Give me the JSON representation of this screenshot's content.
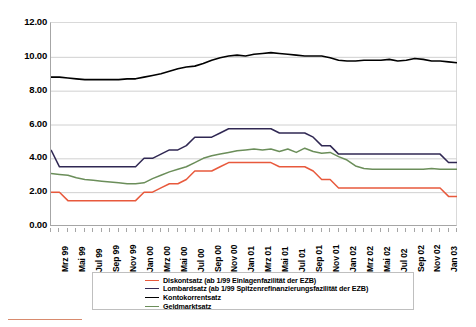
{
  "chart_data": {
    "type": "line",
    "title": "",
    "xlabel": "",
    "ylabel": "",
    "ylim": [
      0,
      12
    ],
    "ytick_labels": [
      "12.00",
      "10.00",
      "8.00",
      "6.00",
      "4.00",
      "2.00",
      "0.00"
    ],
    "ytick_values": [
      12,
      10,
      8,
      6,
      4,
      2,
      0
    ],
    "grid": true,
    "legend_position": "bottom-center",
    "x": [
      "Jan 99",
      "Feb 99",
      "Mrz 99",
      "Apr 99",
      "Mai 99",
      "Jun 99",
      "Jul 99",
      "Aug 99",
      "Sep 99",
      "Okt 99",
      "Nov 99",
      "Dez 99",
      "Jan 00",
      "Feb 00",
      "Mrz 00",
      "Apr 00",
      "Mai 00",
      "Jun 00",
      "Jul 00",
      "Aug 00",
      "Sep 00",
      "Okt 00",
      "Nov 00",
      "Dez 00",
      "Jan 01",
      "Feb 01",
      "Mrz 01",
      "Apr 01",
      "Mai 01",
      "Jun 01",
      "Jul 01",
      "Aug 01",
      "Sep 01",
      "Okt 01",
      "Nov 01",
      "Dez 01",
      "Jan 02",
      "Feb 02",
      "Mrz 02",
      "Apr 02",
      "Mai 02",
      "Jun 02",
      "Jul 02",
      "Aug 02",
      "Sep 02",
      "Okt 02",
      "Nov 02",
      "Dez 02",
      "Jan 03"
    ],
    "x_tick_labels": [
      "Mrz 99",
      "Mai 99",
      "Jul 99",
      "Sep 99",
      "Nov 99",
      "Jan 00",
      "Mrz 00",
      "Mai 00",
      "Jul 00",
      "Sep 00",
      "Nov 00",
      "Jan 01",
      "Mrz 01",
      "Mai 01",
      "Jul 01",
      "Sep 01",
      "Nov 01",
      "Jan 02",
      "Mrz 02",
      "Mai 02",
      "Jul 02",
      "Sep 02",
      "Nov 02",
      "Jan 03"
    ],
    "series": [
      {
        "name": "Diskontsatz (ab 1/99 Einlagenfazilität der EZB)",
        "color": "#E8593C",
        "values": [
          2.0,
          2.0,
          1.5,
          1.5,
          1.5,
          1.5,
          1.5,
          1.5,
          1.5,
          1.5,
          1.5,
          2.0,
          2.0,
          2.25,
          2.5,
          2.5,
          2.75,
          3.25,
          3.25,
          3.25,
          3.5,
          3.75,
          3.75,
          3.75,
          3.75,
          3.75,
          3.75,
          3.5,
          3.5,
          3.5,
          3.5,
          3.25,
          2.75,
          2.75,
          2.25,
          2.25,
          2.25,
          2.25,
          2.25,
          2.25,
          2.25,
          2.25,
          2.25,
          2.25,
          2.25,
          2.25,
          2.25,
          1.75,
          1.75
        ]
      },
      {
        "name": "Lombardsatz (ab 1/99 Spitzenrefinanzierungsfazilität der EZB)",
        "color": "#302853",
        "values": [
          4.5,
          3.5,
          3.5,
          3.5,
          3.5,
          3.5,
          3.5,
          3.5,
          3.5,
          3.5,
          3.5,
          4.0,
          4.0,
          4.25,
          4.5,
          4.5,
          4.75,
          5.25,
          5.25,
          5.25,
          5.5,
          5.75,
          5.75,
          5.75,
          5.75,
          5.75,
          5.75,
          5.5,
          5.5,
          5.5,
          5.5,
          5.25,
          4.75,
          4.75,
          4.25,
          4.25,
          4.25,
          4.25,
          4.25,
          4.25,
          4.25,
          4.25,
          4.25,
          4.25,
          4.25,
          4.25,
          4.25,
          3.75,
          3.75
        ]
      },
      {
        "name": "Kontokorrentsatz",
        "color": "#000000",
        "values": [
          8.8,
          8.8,
          8.75,
          8.7,
          8.65,
          8.65,
          8.65,
          8.65,
          8.65,
          8.7,
          8.7,
          8.8,
          8.9,
          9.0,
          9.15,
          9.3,
          9.4,
          9.45,
          9.6,
          9.8,
          9.95,
          10.05,
          10.1,
          10.05,
          10.15,
          10.2,
          10.25,
          10.2,
          10.15,
          10.1,
          10.05,
          10.05,
          10.05,
          9.95,
          9.8,
          9.75,
          9.75,
          9.8,
          9.8,
          9.8,
          9.85,
          9.75,
          9.8,
          9.9,
          9.85,
          9.75,
          9.75,
          9.7,
          9.65
        ]
      },
      {
        "name": "Geldmarktsatz",
        "color": "#6B8E5A",
        "values": [
          3.1,
          3.05,
          3.0,
          2.85,
          2.75,
          2.7,
          2.65,
          2.6,
          2.55,
          2.5,
          2.5,
          2.55,
          2.8,
          3.0,
          3.2,
          3.35,
          3.5,
          3.75,
          4.0,
          4.15,
          4.25,
          4.35,
          4.45,
          4.5,
          4.55,
          4.5,
          4.55,
          4.4,
          4.55,
          4.35,
          4.6,
          4.4,
          4.3,
          4.35,
          4.1,
          3.9,
          3.55,
          3.4,
          3.35,
          3.35,
          3.35,
          3.35,
          3.35,
          3.35,
          3.35,
          3.4,
          3.35,
          3.35,
          3.35
        ]
      }
    ]
  },
  "legend": {
    "items": [
      {
        "label": "Diskontsatz (ab 1/99 Einlagenfazilität der EZB)",
        "color": "#E8593C"
      },
      {
        "label": "Lombardsatz (ab 1/99 Spitzenrefinanzierungsfazilität der EZB)",
        "color": "#302853"
      },
      {
        "label": "Kontokorrentsatz",
        "color": "#000000"
      },
      {
        "label": "Geldmarktsatz",
        "color": "#6B8E5A"
      }
    ]
  },
  "footer_rule": {
    "color": "#D88B6E"
  }
}
